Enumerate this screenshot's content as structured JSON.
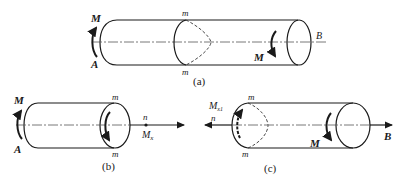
{
  "figure_a": {
    "caption": "(a)",
    "label_M_left": "M",
    "label_A": "A",
    "label_m_top": "m",
    "label_m_bottom": "m",
    "label_M_right": "M",
    "label_B": "B"
  },
  "figure_b": {
    "caption": "(b)",
    "label_M": "M",
    "label_A": "A",
    "label_m_top": "m",
    "label_m_bottom": "m",
    "label_n": "n",
    "label_Mx": "M",
    "label_Mx_sub": "x"
  },
  "figure_c": {
    "caption": "(c)",
    "label_Mx1": "M",
    "label_Mx1_sub": "x1",
    "label_n": "n",
    "label_m_top": "m",
    "label_m_bottom": "m",
    "label_M": "M",
    "label_B": "B"
  }
}
